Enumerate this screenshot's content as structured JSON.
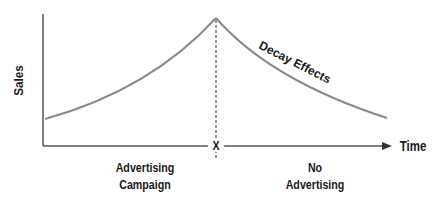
{
  "diagram": {
    "y_axis_label": "Sales",
    "x_axis_label": "Time",
    "marker_label": "X",
    "curve_label": "Decay Effects",
    "left_region_label_line1": "Advertising",
    "left_region_label_line2": "Campaign",
    "right_region_label_line1": "No",
    "right_region_label_line2": "Advertising",
    "colors": {
      "curve": "#8a8a8a",
      "axis": "#555555",
      "text": "#1a1a1a"
    }
  }
}
